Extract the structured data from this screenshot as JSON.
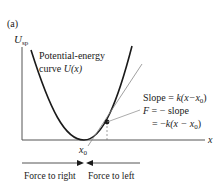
{
  "panel_label": "(a)",
  "y_axis": {
    "symbol": "U",
    "subscript": "sp"
  },
  "x_axis": {
    "symbol": "x"
  },
  "curve_label": {
    "line1": "Potential-energy",
    "line2_prefix": "curve ",
    "line2_func": "U(x)"
  },
  "equilibrium_label": {
    "symbol": "x",
    "subscript": "0"
  },
  "equations": {
    "line1_prefix": "Slope = ",
    "line1_expr": "k(x−x",
    "line1_sub": "0",
    "line1_close": ")",
    "line2_sym": "F",
    "line2_rest": " = − slope",
    "line3_prefix": "= −",
    "line3_expr": "k(x − x",
    "line3_sub": "0",
    "line3_close": ")"
  },
  "force_labels": {
    "left": "Force to right",
    "right": "Force to left"
  },
  "colors": {
    "curve": "#1a1a1a",
    "axis": "#555555",
    "tangent": "#888888",
    "text": "#1a1a1a"
  }
}
